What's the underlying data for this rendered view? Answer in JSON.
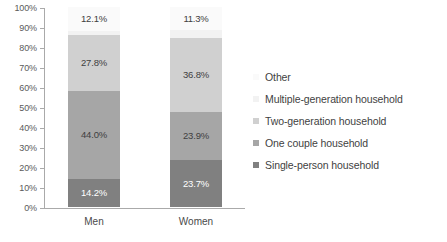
{
  "chart_data": {
    "type": "bar",
    "stacked": true,
    "stack_mode": "percent",
    "title": "",
    "subtitle": "",
    "xlabel": "",
    "ylabel": "",
    "ylim": [
      0,
      100
    ],
    "grid": false,
    "legend_position": "right",
    "categories": [
      "Men",
      "Women"
    ],
    "y_ticks": [
      "0%",
      "10%",
      "20%",
      "30%",
      "40%",
      "50%",
      "60%",
      "70%",
      "80%",
      "90%",
      "100%"
    ],
    "series": [
      {
        "name": "Single-person household",
        "color": "#808080",
        "values": [
          14.2,
          23.7
        ],
        "labels": [
          "14.2%",
          "23.7%"
        ],
        "label_color": "#ffffff"
      },
      {
        "name": "One couple household",
        "color": "#a6a6a6",
        "values": [
          44.0,
          23.9
        ],
        "labels": [
          "44.0%",
          "23.9%"
        ],
        "label_color": "#404040"
      },
      {
        "name": "Two-generation household",
        "color": "#d0d0d0",
        "values": [
          27.8,
          36.8
        ],
        "labels": [
          "27.8%",
          "36.8%"
        ],
        "label_color": "#404040"
      },
      {
        "name": "Multiple-generation household",
        "color": "#f2f2f2",
        "values": [
          1.9,
          4.3
        ],
        "labels": [
          "",
          ""
        ],
        "label_color": "#404040"
      },
      {
        "name": "Other",
        "color": "#fafafa",
        "values": [
          12.1,
          11.3
        ],
        "labels": [
          "12.1%",
          "11.3%"
        ],
        "label_color": "#404040"
      }
    ],
    "legend_entries": [
      {
        "label": "Other",
        "color": "#fafafa"
      },
      {
        "label": "Multiple-generation household",
        "color": "#f2f2f2"
      },
      {
        "label": "Two-generation household",
        "color": "#d0d0d0"
      },
      {
        "label": "One couple household",
        "color": "#a6a6a6"
      },
      {
        "label": "Single-person household",
        "color": "#808080"
      }
    ]
  }
}
